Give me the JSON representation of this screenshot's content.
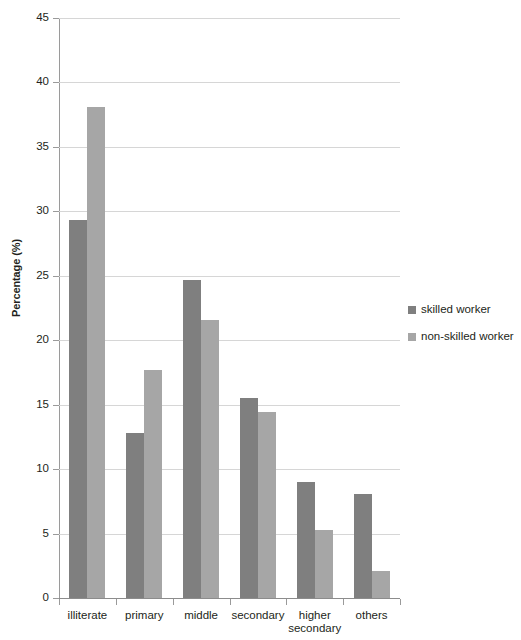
{
  "chart_data": {
    "type": "bar",
    "title": "",
    "xlabel": "",
    "ylabel": "Percentage (%)",
    "ylim": [
      0,
      45
    ],
    "ytick_step": 5,
    "yticks": [
      0,
      5,
      10,
      15,
      20,
      25,
      30,
      35,
      40,
      45
    ],
    "ytick_labels": [
      "0",
      "5",
      "10",
      "15",
      "20",
      "25",
      "30",
      "35",
      "40",
      "45"
    ],
    "grid": true,
    "grid_axis": "y",
    "legend_position": "right",
    "categories": [
      "illiterate",
      "primary",
      "middle",
      "secondary",
      "higher\nsecondary",
      "others"
    ],
    "series": [
      {
        "name": "skilled worker",
        "color": "#7f7f7f",
        "values": [
          29.3,
          12.8,
          24.7,
          15.5,
          9.0,
          8.1
        ]
      },
      {
        "name": "non-skilled worker",
        "color": "#a6a6a6",
        "values": [
          38.1,
          17.7,
          21.6,
          14.4,
          5.3,
          2.1
        ]
      }
    ]
  },
  "legend": {
    "items": [
      {
        "label": "skilled worker",
        "color": "#7f7f7f"
      },
      {
        "label": "non-skilled worker",
        "color": "#a6a6a6"
      }
    ]
  }
}
